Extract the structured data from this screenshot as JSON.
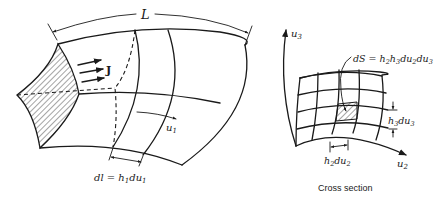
{
  "left_figure": {
    "length_label": "L",
    "current_label": "J",
    "axis_label": "u",
    "axis_subscript": "1",
    "element_label": "dl = h",
    "element_label_sub1": "1",
    "element_label_mid": "du",
    "element_label_sub2": "1"
  },
  "right_figure": {
    "axis_vertical": "u",
    "axis_vertical_sub": "3",
    "axis_horizontal": "u",
    "axis_horizontal_sub": "2",
    "area_label": "dS = h",
    "area_label_parts": [
      "2",
      "h",
      "3",
      "du",
      "2",
      "du",
      "3"
    ],
    "h3_label": "h",
    "h3_sub": "3",
    "h3_du": "du",
    "h3_du_sub": "3",
    "h2_label": "h",
    "h2_sub": "2",
    "h2_du": "du",
    "h2_du_sub": "2",
    "caption": "Cross section"
  },
  "colors": {
    "ink": "#1a1a1a",
    "background": "#ffffff"
  }
}
